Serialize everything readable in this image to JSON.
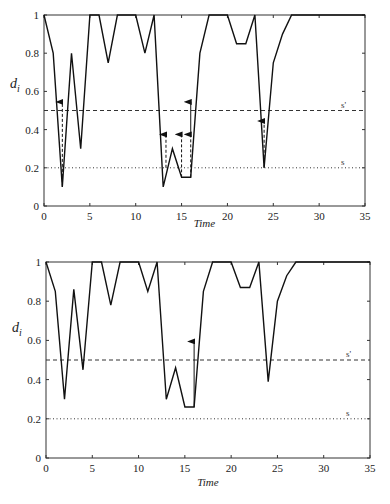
{
  "chart_data": [
    {
      "type": "line",
      "title": "",
      "xlabel": "Time",
      "ylabel": "d_i",
      "xlim": [
        0,
        35
      ],
      "ylim": [
        0,
        1
      ],
      "xticks": [
        0,
        5,
        10,
        15,
        20,
        25,
        30,
        35
      ],
      "yticks": [
        0,
        0.2,
        0.4,
        0.6,
        0.8,
        1
      ],
      "ytick_labels": [
        "0",
        "0.2",
        "0.4",
        "0.6",
        "0.8",
        "1"
      ],
      "grid": false,
      "x": [
        0,
        1,
        2,
        3,
        4,
        5,
        6,
        7,
        8,
        9,
        10,
        11,
        12,
        13,
        14,
        15,
        16,
        17,
        18,
        19,
        20,
        21,
        22,
        23,
        24,
        25,
        26,
        27,
        28,
        29,
        30,
        31,
        32,
        33,
        34,
        35
      ],
      "series": [
        {
          "name": "d_i",
          "values": [
            1,
            0.8,
            0.1,
            0.8,
            0.3,
            1,
            1,
            0.75,
            1,
            1,
            1,
            0.8,
            1,
            0.1,
            0.3,
            0.15,
            0.15,
            0.8,
            1,
            1,
            1,
            0.85,
            0.85,
            1,
            0.2,
            0.75,
            0.9,
            1,
            1,
            1,
            1,
            1,
            1,
            1,
            1,
            1
          ]
        }
      ],
      "thresholds": [
        {
          "label": "s'",
          "value": 0.5,
          "style": "dashed"
        },
        {
          "label": "s",
          "value": 0.2,
          "style": "dotted"
        }
      ],
      "arrows": [
        {
          "x": 2,
          "from": 0.1,
          "to": 0.55,
          "style": "dashed"
        },
        {
          "x": 13.3,
          "from": 0.2,
          "to": 0.38,
          "style": "dashed"
        },
        {
          "x": 15,
          "from": 0.15,
          "to": 0.38,
          "style": "dashed"
        },
        {
          "x": 16,
          "from": 0.15,
          "to": 0.38,
          "style": "dashed"
        },
        {
          "x": 16,
          "from": 0.38,
          "to": 0.55,
          "style": "solid"
        },
        {
          "x": 24,
          "from": 0.2,
          "to": 0.45,
          "style": "dashed"
        }
      ]
    },
    {
      "type": "line",
      "title": "",
      "xlabel": "Time",
      "ylabel": "d_i",
      "xlim": [
        0,
        35
      ],
      "ylim": [
        0,
        1
      ],
      "xticks": [
        0,
        5,
        10,
        15,
        20,
        25,
        30,
        35
      ],
      "yticks": [
        0,
        0.2,
        0.4,
        0.6,
        0.8,
        1
      ],
      "ytick_labels": [
        "0",
        "0.2",
        "0.4",
        "0.6",
        "0.8",
        "1"
      ],
      "grid": false,
      "x": [
        0,
        1,
        2,
        3,
        4,
        5,
        6,
        7,
        8,
        9,
        10,
        11,
        12,
        13,
        14,
        15,
        16,
        17,
        18,
        19,
        20,
        21,
        22,
        23,
        24,
        25,
        26,
        27,
        28,
        29,
        30,
        31,
        32,
        33,
        34,
        35
      ],
      "series": [
        {
          "name": "d_i",
          "values": [
            1,
            0.85,
            0.3,
            0.86,
            0.45,
            1,
            1,
            0.78,
            1,
            1,
            1,
            0.85,
            1,
            0.3,
            0.46,
            0.26,
            0.26,
            0.85,
            1,
            1,
            1,
            0.87,
            0.87,
            1,
            0.39,
            0.8,
            0.93,
            1,
            1,
            1,
            1,
            1,
            1,
            1,
            1,
            1
          ]
        }
      ],
      "thresholds": [
        {
          "label": "s'",
          "value": 0.5,
          "style": "dashed"
        },
        {
          "label": "s",
          "value": 0.2,
          "style": "dotted"
        }
      ],
      "arrows": [
        {
          "x": 16,
          "from": 0.26,
          "to": 0.6,
          "style": "solid"
        }
      ]
    }
  ]
}
